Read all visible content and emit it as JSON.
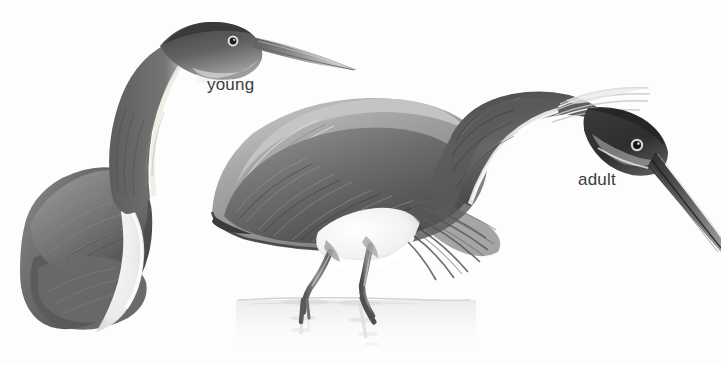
{
  "plate": {
    "title": "Tricolored Heron plumage comparison",
    "medium": "grayscale field-guide illustration",
    "background_color": "#fdfdfd",
    "width": 721,
    "height": 365
  },
  "labels": {
    "young": "young",
    "adult": "adult"
  },
  "figures": [
    {
      "id": "young-heron",
      "label": "young",
      "pose": "standing, neck folded back in S-curve, head held high facing right",
      "description": "Immature heron with dark slate crown and hindneck, pale rufous-white stripe down the foreneck, long dagger bill, dark folded wing with white belly edge",
      "colors": {
        "crown": "#4a4a4a",
        "neck_stripe": "#f2f0ec",
        "body": "#707070",
        "bill": "#8d8d8d"
      }
    },
    {
      "id": "adult-heron",
      "label": "adult",
      "pose": "wading in shallow water, neck extended forward and down, bill angled to lower right",
      "description": "Adult heron with pale grey scapular plumes over dark slate wings, white belly and foreneck stripe, wispy white nape plumes, long dark bill, legs standing in water with faint reflection",
      "colors": {
        "mantle": "#9a9a9a",
        "wing": "#5e5e5e",
        "belly": "#ffffff",
        "bill": "#3c3c3c",
        "legs": "#6f6f6f",
        "water": "#dcdcdc"
      }
    }
  ],
  "scene": {
    "water_line_y": 300,
    "water_color": "#e2e2e2",
    "reflection": "faint vertical leg reflections with horizontal ripples"
  },
  "icons": {
    "young_label": "text-label",
    "adult_label": "text-label"
  }
}
